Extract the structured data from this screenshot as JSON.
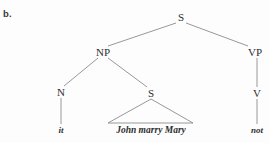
{
  "figure": {
    "item_label": "b.",
    "background_color": "#fdfdfd",
    "line_color": "#8c8c8c",
    "text_color": "#2e2e2e"
  },
  "tree": {
    "nodes": [
      {
        "id": "s-root",
        "label": "S",
        "x": 181,
        "y": 17
      },
      {
        "id": "np",
        "label": "NP",
        "x": 103,
        "y": 52
      },
      {
        "id": "vp",
        "label": "VP",
        "x": 255,
        "y": 52
      },
      {
        "id": "n",
        "label": "N",
        "x": 61,
        "y": 92
      },
      {
        "id": "s-inner",
        "label": "S",
        "x": 151,
        "y": 93
      },
      {
        "id": "v",
        "label": "V",
        "x": 257,
        "y": 93
      }
    ],
    "terminals": [
      {
        "id": "it",
        "label": "it",
        "x": 61,
        "y": 130
      },
      {
        "id": "sent",
        "label": "John marry Mary",
        "x": 151,
        "y": 130
      },
      {
        "id": "not",
        "label": "not",
        "x": 257,
        "y": 130
      }
    ],
    "edges": [
      {
        "id": "s-to-np",
        "x1": 176,
        "y1": 23,
        "x2": 108,
        "y2": 46
      },
      {
        "id": "s-to-vp",
        "x1": 186,
        "y1": 23,
        "x2": 248,
        "y2": 46
      },
      {
        "id": "np-to-n",
        "x1": 98,
        "y1": 58,
        "x2": 64,
        "y2": 86
      },
      {
        "id": "np-to-s",
        "x1": 108,
        "y1": 58,
        "x2": 147,
        "y2": 87
      },
      {
        "id": "vp-to-v",
        "x1": 257,
        "y1": 58,
        "x2": 257,
        "y2": 87
      },
      {
        "id": "n-to-it",
        "x1": 61,
        "y1": 98,
        "x2": 61,
        "y2": 124
      },
      {
        "id": "v-to-not",
        "x1": 257,
        "y1": 99,
        "x2": 257,
        "y2": 124
      }
    ],
    "triangle": {
      "id": "s-inner-triangle",
      "apex_x": 151,
      "apex_y": 99,
      "left_x": 108,
      "left_y": 123,
      "right_x": 193,
      "right_y": 123
    }
  }
}
